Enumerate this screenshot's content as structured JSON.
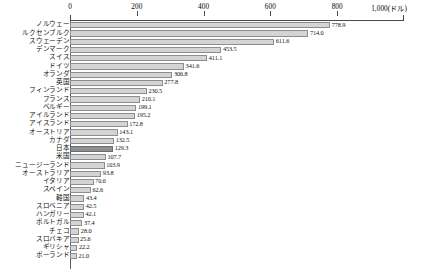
{
  "chart_data": {
    "type": "bar",
    "orientation": "horizontal",
    "title": "",
    "subtitle": "",
    "xlabel": "1,000(ドル)",
    "ylabel": "",
    "unit": "ドル",
    "xlim": [
      0,
      1000
    ],
    "xticks": [
      0,
      200,
      400,
      600,
      800,
      1000
    ],
    "xtick_labels": [
      "0",
      "200",
      "400",
      "600",
      "800",
      "1,000(ドル)"
    ],
    "grid": false,
    "legend": null,
    "highlight_category": "日本",
    "colors": {
      "bar": "#d4d4d4",
      "bar_border": "#8d8d8d",
      "highlight_bar": "#8f8f8f",
      "highlight_border": "#6d6d6d",
      "axis": "#4a4a4a",
      "text": "#111111"
    },
    "categories": [
      "ノルウェー",
      "ルクセンブルク",
      "スウェーデン",
      "デンマーク",
      "スイス",
      "ドイツ",
      "オランダ",
      "英国",
      "フィンランド",
      "フランス",
      "ベルギー",
      "アイルランド",
      "アイスランド",
      "オーストリア",
      "カナダ",
      "日本",
      "米国",
      "ニュージーランド",
      "オーストラリア",
      "イタリア",
      "スペイン",
      "韓国",
      "スロベニア",
      "ハンガリー",
      "ポルトガル",
      "チェコ",
      "スロバキア",
      "ギリシャ",
      "ポーランド"
    ],
    "values": [
      778.9,
      714.0,
      611.6,
      453.5,
      411.1,
      341.6,
      306.8,
      277.8,
      230.5,
      210.1,
      199.1,
      195.2,
      172.8,
      143.1,
      132.5,
      129.3,
      107.7,
      103.9,
      93.8,
      70.6,
      62.6,
      43.4,
      42.5,
      42.1,
      37.4,
      28.0,
      25.6,
      22.2,
      21.0
    ],
    "value_labels": [
      "778.9",
      "714.0",
      "611.6",
      "453.5",
      "411.1",
      "341.6",
      "306.8",
      "277.8",
      "230.5",
      "210.1",
      "199.1",
      "195.2",
      "172.8",
      "143.1",
      "132.5",
      "129.3",
      "107.7",
      "103.9",
      "93.8",
      "70.6",
      "62.6",
      "43.4",
      "42.5",
      "42.1",
      "37.4",
      "28.0",
      "25.6",
      "22.2",
      "21.0"
    ]
  }
}
